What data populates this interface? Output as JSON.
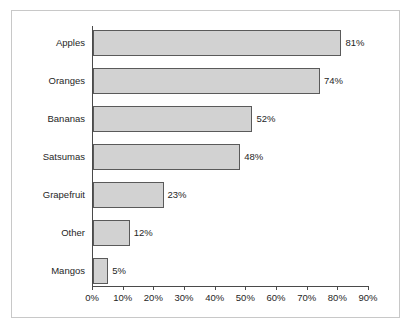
{
  "chart_data": {
    "type": "bar",
    "orientation": "horizontal",
    "title": "",
    "xlabel": "",
    "ylabel": "",
    "categories": [
      "Apples",
      "Oranges",
      "Bananas",
      "Satsumas",
      "Grapefruit",
      "Other",
      "Mangos"
    ],
    "values": [
      81,
      74,
      52,
      48,
      23,
      12,
      5
    ],
    "value_labels": [
      "81%",
      "74%",
      "52%",
      "48%",
      "23%",
      "12%",
      "5%"
    ],
    "xlim": [
      0,
      90
    ],
    "xticks": [
      0,
      10,
      20,
      30,
      40,
      50,
      60,
      70,
      80,
      90
    ],
    "xtick_labels": [
      "0%",
      "10%",
      "20%",
      "30%",
      "40%",
      "50%",
      "60%",
      "70%",
      "80%",
      "90%"
    ],
    "grid": false,
    "legend": false,
    "bar_fill_color": "#d2d2d2",
    "bar_border_color": "#5a5a5a",
    "axis_color": "#4a4a4a",
    "text_color": "#262626",
    "frame_border_color": "#c8c8c8",
    "background_color": "#ffffff"
  }
}
